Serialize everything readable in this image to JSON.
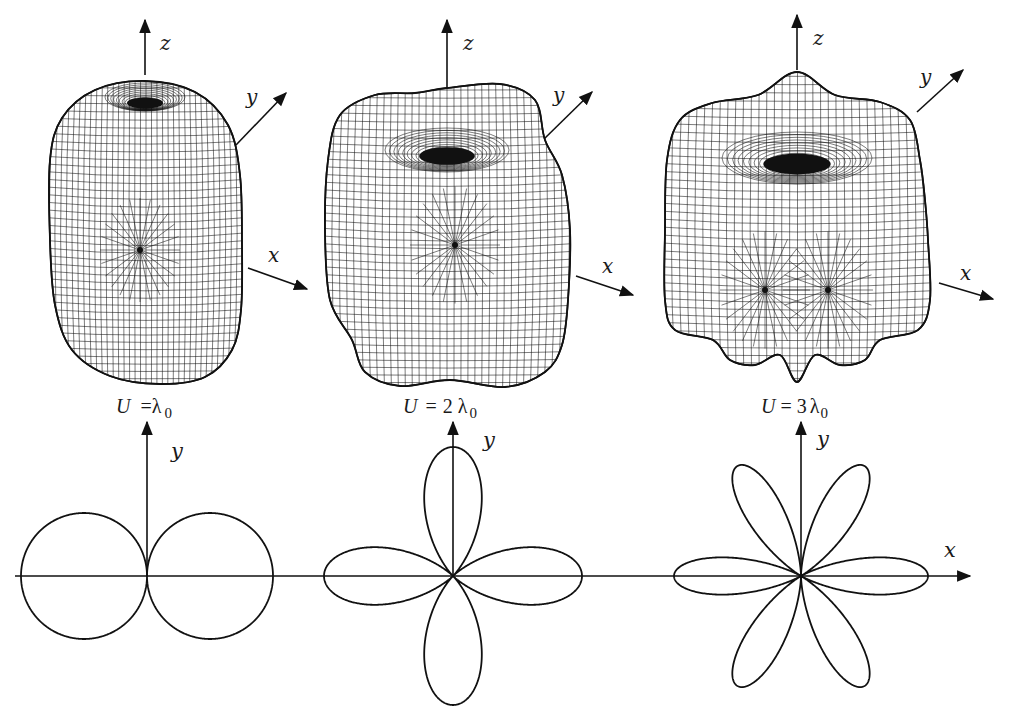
{
  "figure": {
    "panels": [
      {
        "id": "n1",
        "caption": {
          "var": "U",
          "eq": "=",
          "coef": "",
          "sym": "λ",
          "sub": "0"
        },
        "axes3d": {
          "z": "z",
          "y": "y",
          "x": "x"
        },
        "polar_axis_label": "y",
        "lobes": 2
      },
      {
        "id": "n2",
        "caption": {
          "var": "U",
          "eq": "=",
          "coef": "2",
          "sym": "λ",
          "sub": "0"
        },
        "axes3d": {
          "z": "z",
          "y": "y",
          "x": "x"
        },
        "polar_axis_label": "y",
        "lobes": 4
      },
      {
        "id": "n3",
        "caption": {
          "var": "U",
          "eq": "=",
          "coef": "3",
          "sym": "λ",
          "sub": "0"
        },
        "axes3d": {
          "z": "z",
          "y": "y",
          "x": "x"
        },
        "polar_axis_label": "y",
        "lobes": 6
      }
    ],
    "shared_x_axis_label": "x"
  },
  "chart_data": {
    "type": "polar",
    "title": "",
    "series": [
      {
        "name": "U = λ0",
        "lobe_count": 2,
        "lobe_directions_deg": [
          0,
          180
        ],
        "shape": "two tangent circles"
      },
      {
        "name": "U = 2 λ0",
        "lobe_count": 4,
        "lobe_directions_deg": [
          0,
          90,
          180,
          270
        ],
        "shape": "four-leaf"
      },
      {
        "name": "U = 3 λ0",
        "lobe_count": 6,
        "lobe_directions_deg": [
          0,
          60,
          120,
          180,
          240,
          300
        ],
        "shape": "six-leaf"
      }
    ],
    "xlabel": "x",
    "ylabel": "y",
    "grid": false,
    "legend": "none"
  }
}
